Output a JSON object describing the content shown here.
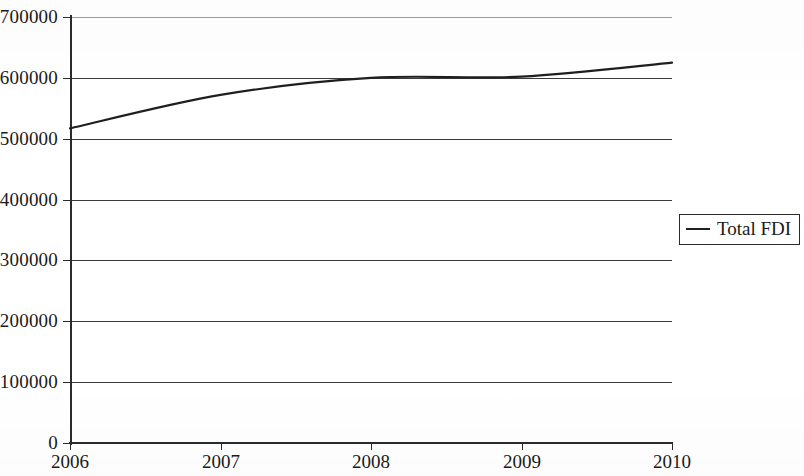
{
  "chart_data": {
    "type": "line",
    "title": "",
    "subtitle": "",
    "xlabel": "",
    "ylabel": "",
    "x": [
      2006,
      2007,
      2008,
      2009,
      2010
    ],
    "categories": [
      "2006",
      "2007",
      "2008",
      "2009",
      "2010"
    ],
    "series": [
      {
        "name": "Total FDI",
        "values": [
          517000,
          572000,
          600000,
          602000,
          625000
        ],
        "color": "#1f1f1f",
        "line_style": "solid",
        "markers": "none",
        "smoothed": true
      }
    ],
    "xlim": [
      2006,
      2010
    ],
    "ylim": [
      0,
      700000
    ],
    "ytick_values": [
      0,
      100000,
      200000,
      300000,
      400000,
      500000,
      600000,
      700000
    ],
    "ytick_labels": [
      "0",
      "100000",
      "200000",
      "300000",
      "400000",
      "500000",
      "600000",
      "700000"
    ],
    "xtick_labels": [
      "2006",
      "2007",
      "2008",
      "2009",
      "2010"
    ],
    "grid": {
      "horizontal": true,
      "vertical": false,
      "color": "#3a3a3a"
    },
    "legend": {
      "entries": [
        {
          "label": "Total FDI",
          "marker": "line"
        }
      ],
      "position": "right",
      "bordered": true
    },
    "axes": {
      "y_axis_visible": true,
      "x_axis_visible": true,
      "tick_marks": true
    }
  },
  "figure": {
    "background_color": "#ffffff",
    "line_color": "#1f1f1f",
    "axis_color": "#2b2b2b"
  }
}
